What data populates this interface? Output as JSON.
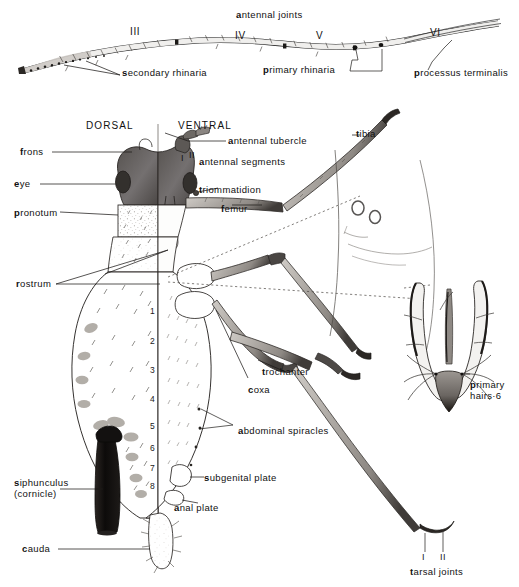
{
  "figure": {
    "background_color": "#ffffff",
    "ink_color": "#1a1a1a"
  },
  "antenna": {
    "heading": "antennal joints",
    "segment_numerals": [
      "III",
      "IV",
      "V",
      "VI"
    ],
    "callouts": [
      "secondary rhinaria",
      "primary rhinaria",
      "processus terminalis"
    ]
  },
  "body_view": {
    "left_heading": "DORSAL",
    "right_heading": "VENTRAL",
    "abdominal_segment_numbers": [
      "1",
      "2",
      "3",
      "4",
      "5",
      "6",
      "7",
      "8"
    ],
    "antennal_segment_numerals": [
      "I",
      "II"
    ]
  },
  "labels_left": [
    {
      "text": "frons"
    },
    {
      "text": "eye"
    },
    {
      "text": "pronotum"
    },
    {
      "text": "rostrum"
    },
    {
      "text": "siphunculus",
      "text2": "(cornicle)"
    },
    {
      "text": "cauda"
    }
  ],
  "labels_right": [
    {
      "text": "antennal tubercle"
    },
    {
      "text": "antennal segments"
    },
    {
      "text": "triommatidion"
    },
    {
      "text": "femur"
    },
    {
      "text": "tibia"
    },
    {
      "text": "trochanter"
    },
    {
      "text": "coxa"
    },
    {
      "text": "abdominal spiracles"
    },
    {
      "text": "subgenital plate"
    },
    {
      "text": "anal plate"
    }
  ],
  "cauda_detail": {
    "label_line1": "primary",
    "label_line2": "hairs·6"
  },
  "tarsus_detail": {
    "label": "tarsal joints",
    "joint_numerals": [
      "I",
      "II"
    ]
  }
}
